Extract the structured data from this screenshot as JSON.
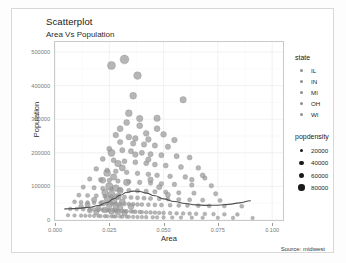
{
  "chart_data": {
    "type": "scatter",
    "title": "Scatterplot",
    "subtitle": "Area Vs Population",
    "caption": "Source: midwest",
    "xlabel": "Area",
    "ylabel": "Population",
    "xlim": [
      0.0,
      0.105
    ],
    "ylim": [
      0,
      530000
    ],
    "xticks": [
      "0.000",
      "0.025",
      "0.050",
      "0.075",
      "0.100"
    ],
    "xtick_values": [
      0.0,
      0.025,
      0.05,
      0.075,
      0.1
    ],
    "yticks": [
      "0",
      "100000",
      "200000",
      "300000",
      "400000",
      "500000"
    ],
    "ytick_values": [
      0,
      100000,
      200000,
      300000,
      400000,
      500000
    ],
    "grid": true,
    "legend_position": "right",
    "point_color": "#9a9a9a",
    "smooth_color": "#4f4f4f",
    "legends": [
      {
        "title": "state",
        "type": "color",
        "entries": [
          "IL",
          "IN",
          "MI",
          "OH",
          "WI"
        ]
      },
      {
        "title": "popdensity",
        "type": "size",
        "entries": [
          "20000",
          "40000",
          "60000",
          "80000"
        ],
        "entry_values": [
          20000,
          40000,
          60000,
          80000
        ],
        "key_sizes": [
          3.0,
          4.2,
          5.4,
          6.6
        ]
      }
    ],
    "smooth_line": [
      [
        0.0045,
        33000
      ],
      [
        0.008,
        34000
      ],
      [
        0.012,
        35500
      ],
      [
        0.016,
        38000
      ],
      [
        0.02,
        43000
      ],
      [
        0.024,
        52000
      ],
      [
        0.027,
        63000
      ],
      [
        0.03,
        74000
      ],
      [
        0.033,
        82000
      ],
      [
        0.036,
        86000
      ],
      [
        0.039,
        85000
      ],
      [
        0.042,
        80000
      ],
      [
        0.046,
        72000
      ],
      [
        0.05,
        63000
      ],
      [
        0.055,
        55000
      ],
      [
        0.06,
        49000
      ],
      [
        0.065,
        45000
      ],
      [
        0.07,
        43500
      ],
      [
        0.075,
        44000
      ],
      [
        0.08,
        46500
      ],
      [
        0.085,
        51000
      ],
      [
        0.09,
        57500
      ]
    ],
    "points": [
      [
        0.026,
        460000,
        4.0
      ],
      [
        0.032,
        478000,
        4.4
      ],
      [
        0.038,
        430000,
        3.8
      ],
      [
        0.036,
        370000,
        3.4
      ],
      [
        0.059,
        358000,
        3.2
      ],
      [
        0.034,
        318000,
        3.4
      ],
      [
        0.033,
        290000,
        3.0
      ],
      [
        0.039,
        302000,
        3.2
      ],
      [
        0.047,
        303000,
        3.2
      ],
      [
        0.039,
        281000,
        3.0
      ],
      [
        0.03,
        272000,
        3.0
      ],
      [
        0.047,
        272000,
        3.0
      ],
      [
        0.042,
        258000,
        2.9
      ],
      [
        0.05,
        255000,
        2.9
      ],
      [
        0.028,
        253000,
        2.8
      ],
      [
        0.034,
        247000,
        2.9
      ],
      [
        0.037,
        243000,
        2.8
      ],
      [
        0.043,
        240000,
        2.8
      ],
      [
        0.055,
        238000,
        2.8
      ],
      [
        0.03,
        232000,
        2.7
      ],
      [
        0.036,
        228000,
        2.7
      ],
      [
        0.041,
        225000,
        2.7
      ],
      [
        0.046,
        222000,
        2.7
      ],
      [
        0.052,
        218000,
        2.7
      ],
      [
        0.025,
        212000,
        2.6
      ],
      [
        0.031,
        208000,
        2.6
      ],
      [
        0.035,
        205000,
        2.6
      ],
      [
        0.04,
        200000,
        2.6
      ],
      [
        0.044,
        196000,
        2.6
      ],
      [
        0.049,
        193000,
        2.6
      ],
      [
        0.056,
        190000,
        2.6
      ],
      [
        0.062,
        186000,
        2.5
      ],
      [
        0.022,
        182000,
        2.5
      ],
      [
        0.027,
        178000,
        2.5
      ],
      [
        0.032,
        175000,
        2.5
      ],
      [
        0.037,
        172000,
        2.5
      ],
      [
        0.042,
        169000,
        2.5
      ],
      [
        0.046,
        165000,
        2.5
      ],
      [
        0.051,
        162000,
        2.5
      ],
      [
        0.058,
        158000,
        2.5
      ],
      [
        0.066,
        155000,
        2.4
      ],
      [
        0.019,
        152000,
        2.4
      ],
      [
        0.024,
        148000,
        2.4
      ],
      [
        0.028,
        145000,
        2.4
      ],
      [
        0.033,
        142000,
        2.4
      ],
      [
        0.038,
        139000,
        2.4
      ],
      [
        0.043,
        136000,
        2.4
      ],
      [
        0.047,
        133000,
        2.4
      ],
      [
        0.053,
        130000,
        2.4
      ],
      [
        0.06,
        128000,
        2.4
      ],
      [
        0.069,
        125000,
        2.3
      ],
      [
        0.016,
        122000,
        2.3
      ],
      [
        0.021,
        120000,
        2.3
      ],
      [
        0.025,
        118000,
        2.3
      ],
      [
        0.029,
        116000,
        2.3
      ],
      [
        0.034,
        114000,
        2.3
      ],
      [
        0.039,
        112000,
        2.3
      ],
      [
        0.044,
        110000,
        2.3
      ],
      [
        0.049,
        108000,
        2.3
      ],
      [
        0.055,
        106000,
        2.3
      ],
      [
        0.063,
        104000,
        2.3
      ],
      [
        0.072,
        102000,
        2.3
      ],
      [
        0.013,
        98000,
        2.2
      ],
      [
        0.018,
        96000,
        2.2
      ],
      [
        0.022,
        94000,
        2.2
      ],
      [
        0.026,
        92000,
        2.2
      ],
      [
        0.03,
        90000,
        2.2
      ],
      [
        0.034,
        88000,
        2.2
      ],
      [
        0.038,
        87000,
        2.2
      ],
      [
        0.042,
        86000,
        2.2
      ],
      [
        0.046,
        84000,
        2.2
      ],
      [
        0.051,
        83000,
        2.2
      ],
      [
        0.057,
        81000,
        2.2
      ],
      [
        0.064,
        80000,
        2.2
      ],
      [
        0.074,
        78000,
        2.2
      ],
      [
        0.011,
        74000,
        2.1
      ],
      [
        0.015,
        73000,
        2.1
      ],
      [
        0.019,
        72000,
        2.1
      ],
      [
        0.023,
        71000,
        2.1
      ],
      [
        0.026,
        70000,
        2.1
      ],
      [
        0.029,
        69000,
        2.1
      ],
      [
        0.032,
        68000,
        2.1
      ],
      [
        0.035,
        67000,
        2.1
      ],
      [
        0.038,
        66000,
        2.1
      ],
      [
        0.041,
        65000,
        2.1
      ],
      [
        0.044,
        64000,
        2.1
      ],
      [
        0.048,
        63000,
        2.1
      ],
      [
        0.052,
        62000,
        2.1
      ],
      [
        0.057,
        61000,
        2.1
      ],
      [
        0.062,
        60000,
        2.1
      ],
      [
        0.068,
        59000,
        2.1
      ],
      [
        0.076,
        58000,
        2.1
      ],
      [
        0.009,
        54000,
        2.0
      ],
      [
        0.012,
        53000,
        2.0
      ],
      [
        0.015,
        52000,
        2.0
      ],
      [
        0.018,
        51500,
        2.0
      ],
      [
        0.021,
        51000,
        2.0
      ],
      [
        0.024,
        50000,
        2.0
      ],
      [
        0.026,
        49500,
        2.0
      ],
      [
        0.028,
        49000,
        2.0
      ],
      [
        0.03,
        48500,
        2.0
      ],
      [
        0.032,
        48000,
        2.0
      ],
      [
        0.034,
        47500,
        2.0
      ],
      [
        0.036,
        47000,
        2.0
      ],
      [
        0.038,
        46500,
        2.0
      ],
      [
        0.04,
        46000,
        2.0
      ],
      [
        0.043,
        45500,
        2.0
      ],
      [
        0.046,
        45000,
        2.0
      ],
      [
        0.049,
        44500,
        2.0
      ],
      [
        0.053,
        44000,
        2.0
      ],
      [
        0.057,
        43500,
        2.0
      ],
      [
        0.061,
        43000,
        2.0
      ],
      [
        0.066,
        42500,
        2.0
      ],
      [
        0.071,
        42000,
        2.0
      ],
      [
        0.078,
        41500,
        2.0
      ],
      [
        0.086,
        41000,
        2.0
      ],
      [
        0.007,
        33000,
        1.9
      ],
      [
        0.01,
        32500,
        1.9
      ],
      [
        0.013,
        32000,
        1.9
      ],
      [
        0.016,
        31500,
        1.9
      ],
      [
        0.018,
        31000,
        1.9
      ],
      [
        0.02,
        30500,
        1.9
      ],
      [
        0.022,
        30000,
        1.9
      ],
      [
        0.024,
        29500,
        1.9
      ],
      [
        0.025,
        29000,
        1.9
      ],
      [
        0.027,
        28500,
        1.9
      ],
      [
        0.028,
        28000,
        1.9
      ],
      [
        0.029,
        27500,
        1.9
      ],
      [
        0.031,
        27000,
        1.9
      ],
      [
        0.032,
        26500,
        1.9
      ],
      [
        0.033,
        26000,
        1.9
      ],
      [
        0.035,
        25500,
        1.9
      ],
      [
        0.036,
        25000,
        1.9
      ],
      [
        0.037,
        24500,
        1.9
      ],
      [
        0.039,
        24000,
        1.9
      ],
      [
        0.04,
        23500,
        1.9
      ],
      [
        0.042,
        23000,
        1.9
      ],
      [
        0.044,
        22500,
        1.9
      ],
      [
        0.046,
        22000,
        1.9
      ],
      [
        0.048,
        21500,
        1.9
      ],
      [
        0.05,
        21000,
        1.9
      ],
      [
        0.053,
        20500,
        1.9
      ],
      [
        0.056,
        20000,
        1.9
      ],
      [
        0.059,
        19500,
        1.9
      ],
      [
        0.062,
        19000,
        1.9
      ],
      [
        0.065,
        18500,
        1.9
      ],
      [
        0.069,
        18000,
        1.9
      ],
      [
        0.073,
        17500,
        1.9
      ],
      [
        0.078,
        17000,
        1.9
      ],
      [
        0.084,
        16500,
        1.9
      ],
      [
        0.006,
        14000,
        1.8
      ],
      [
        0.009,
        13500,
        1.8
      ],
      [
        0.012,
        13000,
        1.8
      ],
      [
        0.014,
        12800,
        1.8
      ],
      [
        0.016,
        12500,
        1.8
      ],
      [
        0.018,
        12200,
        1.8
      ],
      [
        0.02,
        12000,
        1.8
      ],
      [
        0.021,
        11800,
        1.8
      ],
      [
        0.023,
        11500,
        1.8
      ],
      [
        0.024,
        11200,
        1.8
      ],
      [
        0.026,
        11000,
        1.8
      ],
      [
        0.027,
        10800,
        1.8
      ],
      [
        0.028,
        10500,
        1.8
      ],
      [
        0.03,
        10200,
        1.8
      ],
      [
        0.031,
        10000,
        1.8
      ],
      [
        0.033,
        9800,
        1.8
      ],
      [
        0.034,
        9500,
        1.8
      ],
      [
        0.036,
        9200,
        1.8
      ],
      [
        0.038,
        9000,
        1.8
      ],
      [
        0.04,
        8800,
        1.8
      ],
      [
        0.042,
        8500,
        1.8
      ],
      [
        0.045,
        8200,
        1.8
      ],
      [
        0.047,
        8000,
        1.8
      ],
      [
        0.05,
        7800,
        1.8
      ],
      [
        0.054,
        7500,
        1.8
      ],
      [
        0.058,
        7200,
        1.8
      ],
      [
        0.063,
        7000,
        1.8
      ],
      [
        0.068,
        6800,
        1.8
      ],
      [
        0.075,
        6500,
        1.8
      ],
      [
        0.082,
        6200,
        1.8
      ],
      [
        0.091,
        6000,
        1.8
      ],
      [
        0.026,
        200000,
        3.6
      ],
      [
        0.029,
        168000,
        3.3
      ],
      [
        0.031,
        155000,
        3.1
      ],
      [
        0.024,
        140000,
        3.5
      ],
      [
        0.027,
        128000,
        3.2
      ],
      [
        0.022,
        118000,
        3.0
      ],
      [
        0.033,
        112000,
        3.3
      ],
      [
        0.025,
        100000,
        3.8
      ],
      [
        0.028,
        95000,
        3.4
      ],
      [
        0.03,
        88000,
        3.1
      ],
      [
        0.023,
        82000,
        3.2
      ],
      [
        0.026,
        76000,
        3.6
      ],
      [
        0.029,
        70000,
        3.3
      ],
      [
        0.024,
        64000,
        3.0
      ],
      [
        0.027,
        58000,
        3.4
      ],
      [
        0.031,
        54000,
        3.0
      ],
      [
        0.022,
        50000,
        2.9
      ],
      [
        0.025,
        46000,
        3.2
      ],
      [
        0.028,
        42000,
        3.0
      ],
      [
        0.03,
        38000,
        2.9
      ],
      [
        0.02,
        34000,
        2.8
      ],
      [
        0.023,
        30000,
        3.0
      ],
      [
        0.026,
        27000,
        3.2
      ],
      [
        0.029,
        24000,
        2.9
      ],
      [
        0.032,
        21000,
        2.8
      ],
      [
        0.035,
        40000,
        2.9
      ],
      [
        0.018,
        60000,
        2.7
      ],
      [
        0.015,
        45000,
        2.6
      ],
      [
        0.044,
        120000,
        2.8
      ],
      [
        0.048,
        98000,
        2.7
      ],
      [
        0.052,
        75000,
        2.6
      ],
      [
        0.016,
        28000,
        2.5
      ],
      [
        0.019,
        22000,
        2.5
      ],
      [
        0.012,
        40000,
        2.4
      ],
      [
        0.068,
        133000,
        2.5
      ],
      [
        0.063,
        120000,
        2.4
      ],
      [
        0.037,
        195000,
        2.8
      ],
      [
        0.043,
        180000,
        2.7
      ]
    ]
  }
}
